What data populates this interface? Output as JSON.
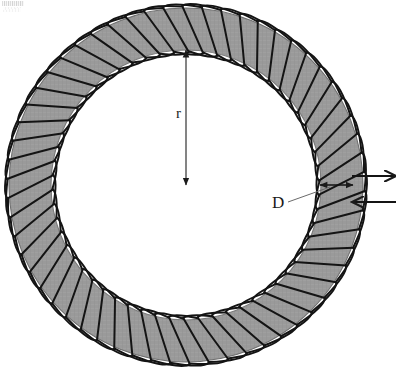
{
  "figure": {
    "type": "physics-diagram",
    "labels": {
      "radius_label": "r",
      "diameter_label": "D"
    },
    "geometry": {
      "center_x": 186,
      "center_y": 185,
      "outer_radius": 177,
      "inner_radius": 135,
      "ring_thickness": 42,
      "turns": 58
    },
    "colors": {
      "ring_fill": "#9a9a9a",
      "ring_edge": "#6d6d6d",
      "winding": "#141414",
      "annotation": "#1a1a1a",
      "background": "#ffffff"
    },
    "annotations": {
      "radius_arrow": {
        "name": "radius-dimension-arrow",
        "from_x": 186,
        "from_y": 50,
        "to_x": 186,
        "to_y": 185,
        "double_headed": true,
        "label": "r",
        "label_x": 176,
        "label_y": 118
      },
      "diameter_arrow": {
        "name": "ring-thickness-dimension-arrow",
        "from_x": 320,
        "from_y": 185,
        "to_x": 353,
        "to_y": 185,
        "double_headed": true,
        "label": "D",
        "label_x": 272,
        "label_y": 208,
        "leader_from_x": 288,
        "leader_from_y": 202,
        "leader_to_x": 330,
        "leader_to_y": 187
      },
      "lead_wire_out": {
        "name": "lead-wire-current-out",
        "x1": 352,
        "y1": 176,
        "x2": 396,
        "y2": 176,
        "arrow_direction": "right"
      },
      "lead_wire_in": {
        "name": "lead-wire-current-in",
        "x1": 396,
        "y1": 202,
        "x2": 352,
        "y2": 202,
        "arrow_direction": "left"
      }
    }
  }
}
